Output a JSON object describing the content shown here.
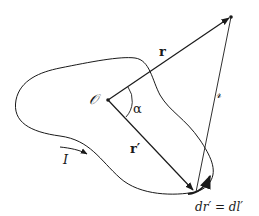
{
  "diagram": {
    "type": "physics-vector-diagram",
    "labels": {
      "origin": "𝒪",
      "r": "r",
      "r_prime": "r′",
      "alpha": "α",
      "script_r": "𝓇",
      "current": "I",
      "element": "dr′ = dl′"
    },
    "colors": {
      "stroke": "#1a1a1a",
      "background": "#ffffff"
    },
    "points": {
      "origin": [
        108,
        100
      ],
      "field_point": [
        231,
        17
      ],
      "source_element": [
        195,
        192
      ]
    }
  }
}
